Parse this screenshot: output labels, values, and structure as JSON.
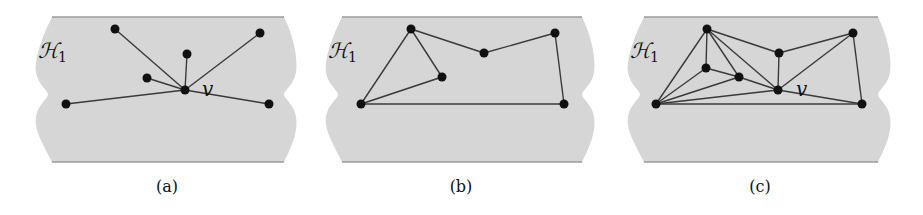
{
  "figure": {
    "colors": {
      "region": "#d6d6d6",
      "border": "#9a9a9a",
      "edge": "#3a3a3a",
      "node": "#111111"
    },
    "region_label": "H",
    "region_label_sub": "1",
    "panels": [
      {
        "id": "a",
        "caption": "(a)",
        "vertex_label": "v",
        "vertex_label_pos": [
          202,
          96
        ],
        "shape": {
          "top": 17,
          "bottom": 162,
          "left": 42,
          "right": 292
        },
        "nodes": [
          [
            115,
            29
          ],
          [
            260,
            33
          ],
          [
            187,
            54
          ],
          [
            147,
            78
          ],
          [
            185,
            90
          ],
          [
            66,
            104
          ],
          [
            269,
            104
          ]
        ],
        "edges": [
          [
            0,
            4
          ],
          [
            1,
            4
          ],
          [
            2,
            4
          ],
          [
            3,
            4
          ],
          [
            5,
            4
          ],
          [
            6,
            4
          ]
        ]
      },
      {
        "id": "b",
        "caption": "(b)",
        "vertex_label": "",
        "shape": {
          "top": 17,
          "bottom": 162,
          "left": 332,
          "right": 590
        },
        "nodes": [
          [
            411,
            29
          ],
          [
            361,
            104
          ],
          [
            442,
            77
          ],
          [
            484,
            53
          ],
          [
            555,
            33
          ],
          [
            564,
            104
          ]
        ],
        "edges": [
          [
            0,
            1
          ],
          [
            0,
            2
          ],
          [
            2,
            1
          ],
          [
            0,
            3
          ],
          [
            3,
            4
          ],
          [
            4,
            5
          ],
          [
            1,
            5
          ]
        ]
      },
      {
        "id": "c",
        "caption": "(c)",
        "vertex_label": "v",
        "vertex_label_pos": [
          796,
          96
        ],
        "shape": {
          "top": 17,
          "bottom": 162,
          "left": 634,
          "right": 886
        },
        "nodes": [
          [
            707,
            29
          ],
          [
            656,
            104
          ],
          [
            706,
            68
          ],
          [
            739,
            77
          ],
          [
            779,
            53
          ],
          [
            778,
            90
          ],
          [
            853,
            33
          ],
          [
            862,
            104
          ]
        ],
        "edges": [
          [
            0,
            1
          ],
          [
            0,
            2
          ],
          [
            0,
            3
          ],
          [
            0,
            5
          ],
          [
            0,
            4
          ],
          [
            2,
            1
          ],
          [
            2,
            3
          ],
          [
            3,
            1
          ],
          [
            3,
            5
          ],
          [
            1,
            5
          ],
          [
            1,
            7
          ],
          [
            4,
            5
          ],
          [
            4,
            6
          ],
          [
            5,
            6
          ],
          [
            5,
            7
          ],
          [
            6,
            7
          ]
        ]
      }
    ]
  }
}
